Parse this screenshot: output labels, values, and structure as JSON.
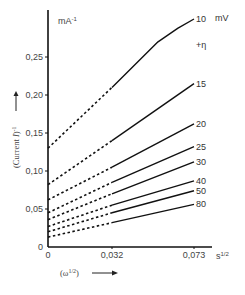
{
  "chart_data": {
    "type": "line",
    "title": "",
    "xlabel": "(ω^1/2)",
    "ylabel": "(Current I)^-1",
    "y_unit": "mA-1",
    "x_unit": "s1/2",
    "legend_title": "+η",
    "legend_unit": "mV",
    "xlim": [
      0,
      0.08
    ],
    "ylim": [
      0,
      0.3
    ],
    "x_ticks": [
      0,
      0.032,
      0.073
    ],
    "x_tick_labels": [
      "0",
      "0,032",
      "0,073"
    ],
    "y_ticks": [
      0,
      0.05,
      0.1,
      0.15,
      0.2,
      0.25
    ],
    "y_tick_labels": [
      "0",
      "0,05",
      "0,10",
      "0,15",
      "0,20",
      "0,25"
    ],
    "grid": false,
    "note": "Dashed segments are extrapolations from x=0.032 back to x=0; solid segments are measured data from x=0.032 to x=0.073",
    "x": [
      0,
      0.032,
      0.073
    ],
    "series": [
      {
        "name": "10",
        "values": [
          0.13,
          0.21,
          0.3
        ],
        "curve_points": [
          [
            0.032,
            0.21
          ],
          [
            0.055,
            0.27
          ],
          [
            0.065,
            0.288
          ],
          [
            0.073,
            0.3
          ]
        ]
      },
      {
        "name": "15",
        "values": [
          0.082,
          0.14,
          0.215
        ]
      },
      {
        "name": "20",
        "values": [
          0.062,
          0.105,
          0.162
        ]
      },
      {
        "name": "25",
        "values": [
          0.045,
          0.085,
          0.132
        ]
      },
      {
        "name": "30",
        "values": [
          0.036,
          0.07,
          0.112
        ]
      },
      {
        "name": "40",
        "values": [
          0.027,
          0.055,
          0.087
        ]
      },
      {
        "name": "50",
        "values": [
          0.02,
          0.045,
          0.074
        ]
      },
      {
        "name": "80",
        "values": [
          0.013,
          0.032,
          0.056
        ]
      }
    ]
  },
  "labels": {
    "y_unit": "mA",
    "y_unit_exp": "-1",
    "x_unit": "s",
    "x_unit_exp": "1/2",
    "legend_unit": "mV",
    "legend_title": "+η",
    "ylabel_main": "(Current ",
    "ylabel_italic": "I",
    "ylabel_end": ")",
    "ylabel_exp": "-1",
    "xlabel_main": "(ω",
    "xlabel_exp": "1/2",
    "xlabel_end": ")"
  }
}
